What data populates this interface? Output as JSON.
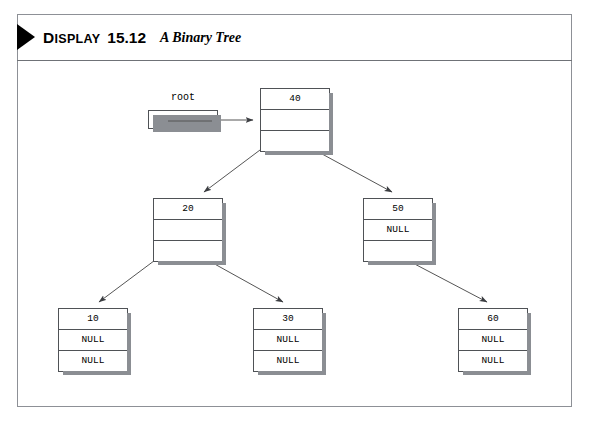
{
  "display": {
    "kicker_first": "D",
    "kicker_rest": "ISPLAY",
    "number": "15.12",
    "title": "A Binary Tree"
  },
  "diagram": {
    "root_pointer_label": "root",
    "null_text": "NULL",
    "nodes": [
      {
        "id": "n40",
        "value": "40",
        "left": "NULL",
        "right": "NULL",
        "left_is_null": false,
        "right_is_null": false,
        "x": 260,
        "y": 88
      },
      {
        "id": "n20",
        "value": "20",
        "left": "NULL",
        "right": "NULL",
        "left_is_null": false,
        "right_is_null": false,
        "x": 153,
        "y": 198
      },
      {
        "id": "n50",
        "value": "50",
        "left": "NULL",
        "right": "NULL",
        "left_is_null": true,
        "right_is_null": false,
        "x": 363,
        "y": 198
      },
      {
        "id": "n10",
        "value": "10",
        "left": "NULL",
        "right": "NULL",
        "left_is_null": true,
        "right_is_null": true,
        "x": 58,
        "y": 308
      },
      {
        "id": "n30",
        "value": "30",
        "left": "NULL",
        "right": "NULL",
        "left_is_null": true,
        "right_is_null": true,
        "x": 253,
        "y": 308
      },
      {
        "id": "n60",
        "value": "60",
        "left": "NULL",
        "right": "NULL",
        "left_is_null": true,
        "right_is_null": true,
        "x": 458,
        "y": 308
      }
    ],
    "edges": [
      {
        "from": "root",
        "to": "n40"
      },
      {
        "from": "n40",
        "to": "n20",
        "side": "left"
      },
      {
        "from": "n40",
        "to": "n50",
        "side": "right"
      },
      {
        "from": "n20",
        "to": "n10",
        "side": "left"
      },
      {
        "from": "n20",
        "to": "n30",
        "side": "right"
      },
      {
        "from": "n50",
        "to": "n60",
        "side": "right"
      }
    ],
    "colors": {
      "line": "#555555",
      "box_border": "#4f5256",
      "shadow": "#8b8e93",
      "background": "#ffffff"
    }
  }
}
